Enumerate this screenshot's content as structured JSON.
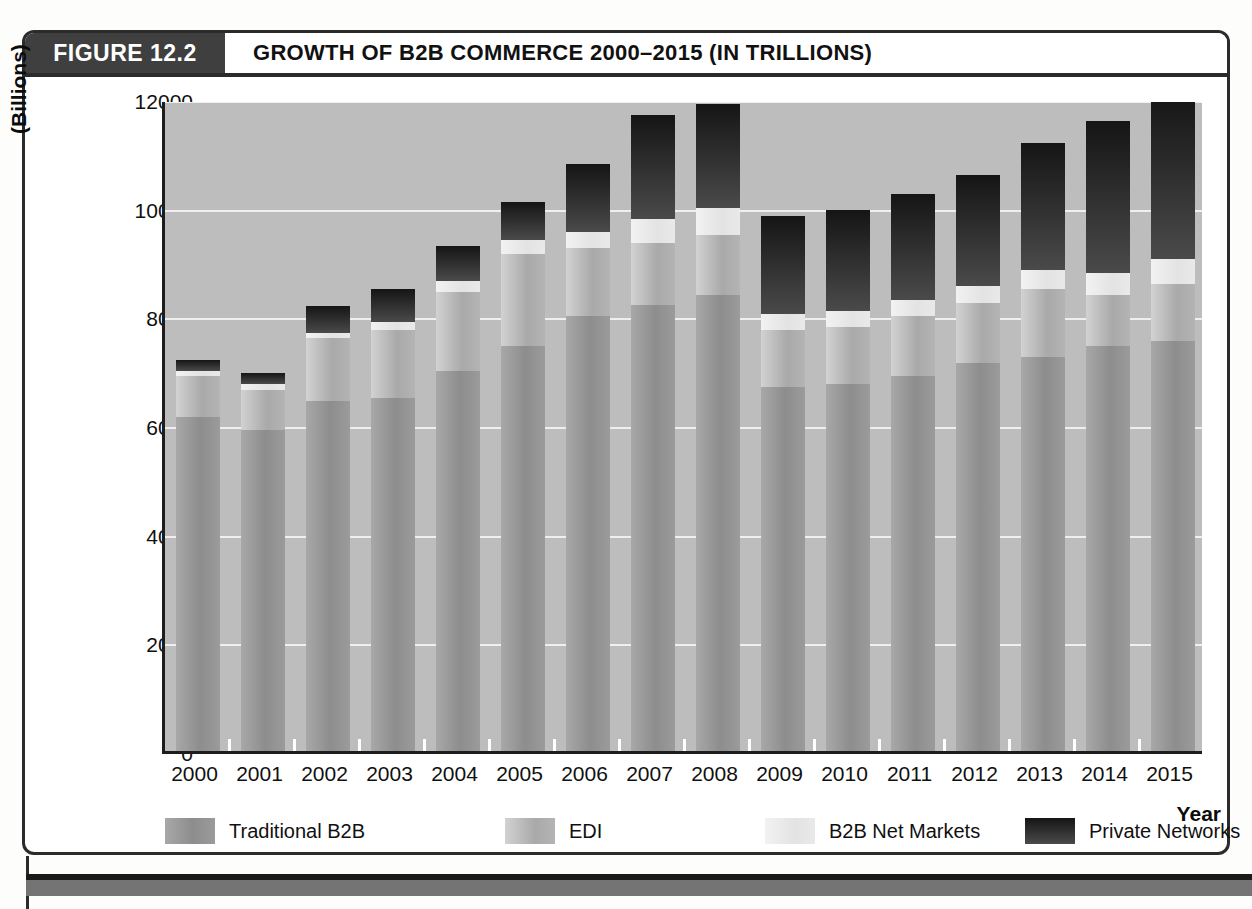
{
  "figure": {
    "number_label": "FIGURE 12.2",
    "title": "GROWTH OF B2B COMMERCE 2000–2015 (IN TRILLIONS)"
  },
  "axes": {
    "y_axis_label": "(Billions)",
    "x_axis_label": "Year",
    "y_ticks": [
      "12000",
      "10000",
      "8000",
      "6000",
      "4000",
      "2000",
      "0"
    ]
  },
  "legend": {
    "items": [
      {
        "label": "Traditional B2B",
        "color": "#8d8d8d"
      },
      {
        "label": "EDI",
        "color": "#a9a9a9"
      },
      {
        "label": "B2B Net Markets",
        "color": "#e3e3e3"
      },
      {
        "label": "Private Networks",
        "color": "#252525"
      }
    ]
  },
  "chart_data": {
    "type": "bar",
    "subtype": "stacked",
    "title": "GROWTH OF B2B COMMERCE 2000–2015 (IN TRILLIONS)",
    "xlabel": "Year",
    "ylabel": "(Billions)",
    "ylim": [
      0,
      12000
    ],
    "ytick_step": 2000,
    "grid": true,
    "legend_position": "bottom",
    "categories": [
      "2000",
      "2001",
      "2002",
      "2003",
      "2004",
      "2005",
      "2006",
      "2007",
      "2008",
      "2009",
      "2010",
      "2011",
      "2012",
      "2013",
      "2014",
      "2015"
    ],
    "series": [
      {
        "name": "Traditional B2B",
        "color": "#8d8d8d",
        "values": [
          6150,
          5900,
          6450,
          6500,
          7000,
          7450,
          8000,
          8200,
          8400,
          6700,
          6750,
          6900,
          7150,
          7250,
          7450,
          7550
        ]
      },
      {
        "name": "EDI",
        "color": "#a9a9a9",
        "values": [
          750,
          750,
          1150,
          1250,
          1450,
          1700,
          1250,
          1150,
          1100,
          1050,
          1050,
          1100,
          1100,
          1250,
          950,
          1050
        ]
      },
      {
        "name": "B2B Net Markets",
        "color": "#e3e3e3",
        "values": [
          100,
          100,
          100,
          150,
          200,
          250,
          300,
          450,
          500,
          300,
          300,
          300,
          300,
          350,
          400,
          450
        ]
      },
      {
        "name": "Private Networks",
        "color": "#252525",
        "values": [
          200,
          200,
          500,
          600,
          650,
          700,
          1250,
          1900,
          1900,
          1800,
          1850,
          1950,
          2050,
          2350,
          2800,
          3050
        ]
      }
    ],
    "totals": [
      7200,
      6950,
      8200,
      8500,
      9300,
      10100,
      10800,
      11700,
      11900,
      9850,
      9950,
      10250,
      10600,
      11200,
      11600,
      12100
    ]
  }
}
